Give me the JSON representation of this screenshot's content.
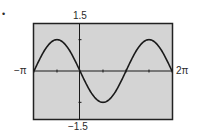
{
  "chart_data": {
    "type": "line",
    "title": "",
    "xlabel": "",
    "ylabel": "",
    "function": "y = -sin(x)",
    "xlim": [
      "-π",
      "2π"
    ],
    "xlim_numeric": [
      -3.14159,
      6.28319
    ],
    "ylim": [
      -1.5,
      1.5
    ],
    "x_tick_step": "π/2",
    "y_tick_step": 1,
    "grid": false,
    "legend": null,
    "labels": {
      "ymax": "1.5",
      "ymin": "−1.5",
      "xmin": "−π",
      "xmax": "2π"
    },
    "series": [
      {
        "name": "-sin(x)",
        "x": [
          -3.1416,
          -2.3562,
          -1.5708,
          -0.7854,
          0,
          0.7854,
          1.5708,
          2.3562,
          3.1416,
          3.927,
          4.7124,
          5.4978,
          6.2832
        ],
        "values": [
          0,
          0.707,
          1,
          0.707,
          0,
          -0.707,
          -1,
          -0.707,
          0,
          0.707,
          1,
          0.707,
          0
        ]
      }
    ],
    "colors": {
      "plot_background": "#d4d4d4",
      "frame": "#222222",
      "curve": "#1a1a1a",
      "axes": "#1a1a1a"
    }
  },
  "marker": "•"
}
